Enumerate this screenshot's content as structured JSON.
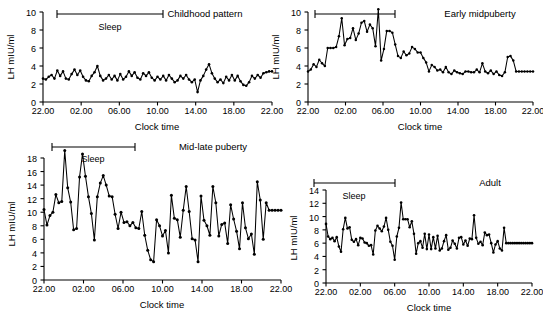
{
  "figure": {
    "background": "#ffffff",
    "line_color": "#000000",
    "axis_label_y": "LH mIU/ml",
    "axis_label_x": "Clock time",
    "sleep_label": "Sleep",
    "x_tick_labels": [
      "22.00",
      "02.00",
      "06.00",
      "10.00",
      "14.00",
      "18.00",
      "22.00"
    ]
  },
  "chart_data": [
    {
      "type": "line",
      "title": "Childhood pattern",
      "xlabel": "Clock time",
      "ylabel": "LH mIU/ml",
      "xlim": [
        22,
        46
      ],
      "ylim": [
        0,
        10
      ],
      "yticks": [
        0,
        2,
        4,
        6,
        8,
        10
      ],
      "xticks": [
        22,
        26,
        30,
        34,
        38,
        42,
        46
      ],
      "xtick_labels": [
        "22.00",
        "02.00",
        "06.00",
        "10.00",
        "14.00",
        "18.00",
        "22.00"
      ],
      "grid": false,
      "legend": "none",
      "annotations": [
        {
          "label": "Sleep",
          "x_start": 22.0,
          "x_end": 30.5,
          "y": 10.0
        }
      ],
      "x": [
        22.0,
        22.3,
        22.6,
        22.9,
        23.2,
        23.5,
        23.8,
        24.1,
        24.4,
        24.7,
        25.0,
        25.3,
        25.6,
        25.9,
        26.2,
        26.5,
        26.8,
        27.1,
        27.4,
        27.7,
        28.0,
        28.3,
        28.6,
        28.9,
        29.2,
        29.5,
        29.8,
        30.1,
        30.4,
        30.7,
        31.0,
        31.3,
        31.6,
        31.9,
        32.2,
        32.5,
        32.8,
        33.1,
        33.4,
        33.7,
        34.0,
        34.3,
        34.6,
        34.9,
        35.2,
        35.5,
        35.8,
        36.1,
        36.4,
        36.7,
        37.0,
        37.3,
        37.6,
        37.9,
        38.2,
        38.5,
        38.8,
        39.1,
        39.4,
        39.7,
        40.0,
        40.3,
        40.6,
        40.9,
        41.2,
        41.5,
        41.8,
        42.1,
        42.4,
        42.7,
        43.0,
        43.3,
        43.6,
        43.9,
        44.2,
        44.5,
        44.8,
        45.1,
        45.4,
        45.7,
        46.0
      ],
      "values": [
        2.6,
        2.5,
        2.8,
        3.0,
        2.6,
        3.5,
        2.9,
        3.4,
        2.6,
        2.5,
        3.1,
        3.6,
        3.0,
        3.5,
        2.8,
        2.4,
        2.3,
        2.9,
        3.3,
        4.0,
        2.9,
        2.4,
        2.6,
        3.0,
        2.5,
        2.9,
        2.4,
        3.1,
        2.5,
        2.8,
        3.4,
        2.9,
        3.3,
        2.7,
        2.5,
        3.2,
        2.9,
        3.3,
        2.7,
        2.4,
        2.8,
        2.5,
        2.9,
        2.4,
        3.0,
        2.6,
        2.2,
        2.4,
        2.9,
        2.6,
        3.0,
        2.5,
        2.2,
        2.5,
        1.1,
        2.4,
        2.9,
        3.6,
        4.2,
        3.2,
        2.6,
        2.2,
        2.5,
        2.1,
        2.8,
        2.4,
        3.0,
        2.4,
        2.9,
        2.3,
        1.9,
        1.8,
        2.2,
        2.9,
        2.6,
        3.0,
        2.7,
        3.2,
        3.3,
        3.4,
        3.4
      ]
    },
    {
      "type": "line",
      "title": "Early midpuberty",
      "xlabel": "Clock time",
      "ylabel": "LH mIU/ml",
      "xlim": [
        22,
        46
      ],
      "ylim": [
        0,
        10
      ],
      "yticks": [
        0,
        2,
        4,
        6,
        8,
        10
      ],
      "xticks": [
        22,
        26,
        30,
        34,
        38,
        42,
        46
      ],
      "xtick_labels": [
        "22.00",
        "02.00",
        "06.00",
        "10.00",
        "14.00",
        "18.00",
        "22.00"
      ],
      "grid": false,
      "legend": "none",
      "annotations": [
        {
          "label": "",
          "x_start": 22.0,
          "x_end": 30.5,
          "y": 10.0
        }
      ],
      "x": [
        22.0,
        22.3,
        22.6,
        22.9,
        23.2,
        23.5,
        23.8,
        24.1,
        24.4,
        24.7,
        25.0,
        25.3,
        25.6,
        25.9,
        26.2,
        26.5,
        26.8,
        27.1,
        27.4,
        27.7,
        28.0,
        28.3,
        28.6,
        28.9,
        29.2,
        29.5,
        29.8,
        30.1,
        30.4,
        30.7,
        31.0,
        31.3,
        31.6,
        31.9,
        32.2,
        32.5,
        32.8,
        33.1,
        33.4,
        33.7,
        34.0,
        34.3,
        34.6,
        34.9,
        35.2,
        35.5,
        35.8,
        36.1,
        36.4,
        36.7,
        37.0,
        37.3,
        37.6,
        37.9,
        38.2,
        38.5,
        38.8,
        39.1,
        39.4,
        39.7,
        40.0,
        40.3,
        40.6,
        40.9,
        41.2,
        41.5,
        41.8,
        42.1,
        42.4,
        42.7,
        43.0,
        43.3,
        43.6,
        43.9,
        44.2,
        44.5,
        44.8,
        45.1,
        45.4,
        45.7,
        46.0
      ],
      "values": [
        3.4,
        3.6,
        4.2,
        3.9,
        4.7,
        4.3,
        4.0,
        6.0,
        6.0,
        6.0,
        6.1,
        7.3,
        9.3,
        6.3,
        7.0,
        7.1,
        8.2,
        6.9,
        7.6,
        8.8,
        9.0,
        7.8,
        8.6,
        8.2,
        6.2,
        10.3,
        4.6,
        5.9,
        7.9,
        7.9,
        7.7,
        6.4,
        5.1,
        4.9,
        5.6,
        5.2,
        5.4,
        6.1,
        5.9,
        5.5,
        5.5,
        4.9,
        4.4,
        3.4,
        4.1,
        3.9,
        3.5,
        3.6,
        3.3,
        3.9,
        3.3,
        3.1,
        3.5,
        3.3,
        3.2,
        3.1,
        3.4,
        3.4,
        3.3,
        3.3,
        3.6,
        3.3,
        4.3,
        3.4,
        3.2,
        3.5,
        3.1,
        3.4,
        3.0,
        2.9,
        3.3,
        5.0,
        5.1,
        4.6,
        3.4,
        3.4,
        3.4,
        3.4,
        3.4,
        3.4,
        3.4
      ]
    },
    {
      "type": "line",
      "title": "Mid-late puberty",
      "xlabel": "Clock time",
      "ylabel": "LH mIU/ml",
      "xlim": [
        22,
        46
      ],
      "ylim": [
        0,
        18
      ],
      "yticks": [
        0,
        2,
        4,
        6,
        8,
        10,
        12,
        14,
        16,
        18
      ],
      "xticks": [
        22,
        26,
        30,
        34,
        38,
        42,
        46
      ],
      "xtick_labels": [
        "22.00",
        "02.00",
        "06.00",
        "10.00",
        "14.00",
        "18.00",
        "22.00"
      ],
      "grid": false,
      "legend": "none",
      "annotations": [
        {
          "label": "Sleep",
          "x_start": 22.0,
          "x_end": 30.5,
          "y": 18.0
        }
      ],
      "x": [
        22.0,
        22.3,
        22.6,
        22.9,
        23.2,
        23.5,
        23.8,
        24.1,
        24.4,
        24.7,
        25.0,
        25.3,
        25.6,
        25.9,
        26.2,
        26.5,
        26.8,
        27.1,
        27.4,
        27.7,
        28.0,
        28.3,
        28.6,
        28.9,
        29.2,
        29.5,
        29.8,
        30.1,
        30.4,
        30.7,
        31.0,
        31.3,
        31.6,
        31.9,
        32.2,
        32.5,
        32.8,
        33.1,
        33.4,
        33.7,
        34.0,
        34.3,
        34.6,
        34.9,
        35.2,
        35.5,
        35.8,
        36.1,
        36.4,
        36.7,
        37.0,
        37.3,
        37.6,
        37.9,
        38.2,
        38.5,
        38.8,
        39.1,
        39.4,
        39.7,
        40.0,
        40.3,
        40.6,
        40.9,
        41.2,
        41.5,
        41.8,
        42.1,
        42.4,
        42.7,
        43.0,
        43.3,
        43.6,
        43.9,
        44.2,
        44.5,
        44.8,
        45.1,
        45.4,
        45.7,
        46.0
      ],
      "values": [
        10.4,
        8.1,
        9.5,
        10.0,
        12.6,
        11.4,
        11.6,
        19.1,
        13.6,
        11.5,
        7.4,
        7.6,
        15.2,
        18.6,
        15.3,
        12.3,
        9.8,
        5.9,
        12.3,
        14.3,
        15.4,
        14.0,
        12.4,
        12.3,
        9.7,
        7.6,
        10.0,
        8.5,
        8.6,
        8.0,
        8.5,
        7.7,
        7.6,
        10.1,
        6.6,
        4.4,
        3.0,
        2.7,
        8.9,
        8.0,
        6.5,
        7.3,
        4.0,
        12.5,
        9.1,
        8.9,
        6.3,
        10.3,
        13.8,
        10.1,
        6.1,
        5.9,
        2.7,
        12.4,
        8.8,
        8.0,
        6.6,
        13.8,
        11.4,
        6.5,
        8.2,
        8.4,
        5.4,
        11.1,
        9.0,
        7.2,
        4.6,
        11.4,
        7.7,
        6.1,
        6.8,
        3.8,
        14.5,
        11.8,
        6.0,
        11.4,
        10.3,
        10.3,
        10.3,
        10.3,
        10.3
      ]
    },
    {
      "type": "line",
      "title": "Adult",
      "xlabel": "Clock time",
      "ylabel": "LH mIU/ml",
      "xlim": [
        22,
        46
      ],
      "ylim": [
        0,
        14
      ],
      "yticks": [
        0,
        2,
        4,
        6,
        8,
        10,
        12,
        14
      ],
      "xticks": [
        22,
        26,
        30,
        34,
        38,
        42,
        46
      ],
      "xtick_labels": [
        "22.00",
        "02.00",
        "06.00",
        "10.00",
        "14.00",
        "18.00",
        "22.00"
      ],
      "grid": false,
      "legend": "none",
      "annotations": [
        {
          "label": "Sleep",
          "x_start": 22.0,
          "x_end": 30.5,
          "y": 14.0
        }
      ],
      "x": [
        22.0,
        22.25,
        22.5,
        22.75,
        23.0,
        23.25,
        23.5,
        23.75,
        24.0,
        24.25,
        24.5,
        24.75,
        25.0,
        25.25,
        25.5,
        25.75,
        26.0,
        26.25,
        26.5,
        26.75,
        27.0,
        27.25,
        27.5,
        27.75,
        28.0,
        28.25,
        28.5,
        28.75,
        29.0,
        29.25,
        29.5,
        29.75,
        30.0,
        30.25,
        30.5,
        30.75,
        31.0,
        31.25,
        31.5,
        31.75,
        32.0,
        32.25,
        32.5,
        32.75,
        33.0,
        33.25,
        33.5,
        33.75,
        34.0,
        34.25,
        34.5,
        34.75,
        35.0,
        35.25,
        35.5,
        35.75,
        36.0,
        36.25,
        36.5,
        36.75,
        37.0,
        37.25,
        37.5,
        37.75,
        38.0,
        38.25,
        38.5,
        38.75,
        39.0,
        39.25,
        39.5,
        39.75,
        40.0,
        40.25,
        40.5,
        40.75,
        41.0,
        41.25,
        41.5,
        41.75,
        42.0,
        42.25,
        42.5,
        42.75,
        43.0,
        43.25,
        43.5,
        43.75,
        44.0,
        44.25,
        44.5,
        44.75,
        45.0,
        45.25,
        45.5,
        45.75,
        46.0
      ],
      "values": [
        8.9,
        7.0,
        6.6,
        6.8,
        6.3,
        6.9,
        5.5,
        4.7,
        8.1,
        9.8,
        8.2,
        8.4,
        6.5,
        6.2,
        6.6,
        5.7,
        6.8,
        6.7,
        6.1,
        6.0,
        5.6,
        5.7,
        4.3,
        7.9,
        8.6,
        8.2,
        7.8,
        8.5,
        9.8,
        8.0,
        6.2,
        5.6,
        3.5,
        7.0,
        8.3,
        12.1,
        9.6,
        9.6,
        9.6,
        8.4,
        9.3,
        7.4,
        4.4,
        6.0,
        6.3,
        5.3,
        7.4,
        5.1,
        7.3,
        5.1,
        6.9,
        5.2,
        7.1,
        4.9,
        5.2,
        6.3,
        7.2,
        5.0,
        5.3,
        6.4,
        5.9,
        5.2,
        6.8,
        6.9,
        5.8,
        6.4,
        5.6,
        6.7,
        6.6,
        10.2,
        6.8,
        5.9,
        6.2,
        5.7,
        7.6,
        7.2,
        7.3,
        6.0,
        4.6,
        5.8,
        6.3,
        5.2,
        4.9,
        8.3,
        6.0,
        6.0,
        6.0,
        6.0,
        6.0,
        6.0,
        6.0,
        6.0,
        6.0,
        6.0,
        6.0,
        6.0,
        6.0
      ]
    }
  ]
}
